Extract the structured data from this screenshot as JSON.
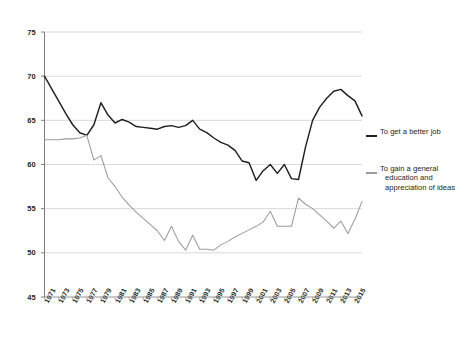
{
  "chart_data": {
    "type": "line",
    "title": "",
    "subtitle": "",
    "xlabel": "",
    "ylabel": "",
    "ylim": [
      45,
      75
    ],
    "ytick_values": [
      45,
      50,
      55,
      60,
      65,
      70,
      75
    ],
    "ytick_labels": [
      "45",
      "50",
      "55",
      "60",
      "65",
      "70",
      "75"
    ],
    "xlim": [
      1971,
      2016
    ],
    "xtick_labels": [
      "1971",
      "1973",
      "1975",
      "1977",
      "1979",
      "1981",
      "1983",
      "1985",
      "1987",
      "1989",
      "1991",
      "1993",
      "1995",
      "1997",
      "1999",
      "2001",
      "2003",
      "2005",
      "2007",
      "2009",
      "2011",
      "2013",
      "2015"
    ],
    "x": [
      1971,
      1972,
      1973,
      1974,
      1975,
      1976,
      1977,
      1978,
      1979,
      1980,
      1981,
      1982,
      1983,
      1984,
      1985,
      1986,
      1987,
      1988,
      1989,
      1990,
      1991,
      1992,
      1993,
      1994,
      1995,
      1996,
      1997,
      1998,
      1999,
      2000,
      2001,
      2002,
      2003,
      2004,
      2005,
      2006,
      2007,
      2008,
      2009,
      2010,
      2011,
      2012,
      2013,
      2014,
      2015,
      2016
    ],
    "grid": true,
    "grid_axis": "y",
    "legend_position": "right",
    "series": [
      {
        "name": "To get a better job",
        "color": "#231f20",
        "values": [
          70.0,
          68.6,
          67.2,
          65.8,
          64.5,
          63.6,
          63.3,
          64.5,
          67.0,
          65.6,
          64.7,
          65.1,
          64.8,
          64.3,
          64.2,
          64.1,
          64.0,
          64.3,
          64.4,
          64.2,
          64.4,
          65.0,
          64.0,
          63.6,
          63.0,
          62.5,
          62.2,
          61.6,
          60.4,
          60.2,
          58.2,
          59.3,
          60.0,
          59.0,
          60.0,
          58.4,
          58.3,
          62.0,
          65.0,
          66.5,
          67.5,
          68.3,
          68.5,
          67.8,
          67.2,
          65.5
        ]
      },
      {
        "name": "To gain a general education and appreciation of ideas",
        "color": "#9b9b9b",
        "values": [
          62.8,
          62.8,
          62.8,
          62.9,
          62.9,
          63.0,
          63.3,
          60.5,
          61.0,
          58.5,
          57.5,
          56.3,
          55.4,
          54.6,
          53.9,
          53.2,
          52.5,
          51.4,
          53.0,
          51.3,
          50.3,
          52.0,
          50.4,
          50.4,
          50.3,
          50.9,
          51.3,
          51.8,
          52.2,
          52.6,
          53.0,
          53.5,
          54.7,
          53.0,
          53.0,
          53.0,
          56.2,
          55.5,
          55.0,
          54.3,
          53.6,
          52.8,
          53.6,
          52.2,
          53.8,
          55.8
        ]
      }
    ]
  },
  "legend": {
    "items": [
      {
        "label": "To get a better job",
        "line1": "To get a better job",
        "line2": "",
        "line3": "",
        "color": "#231f20"
      },
      {
        "label": "To gain a general education and appreciation of ideas",
        "line1": "To gain a general",
        "line2": "education and",
        "line3": "appreciation of ideas",
        "color": "#9b9b9b"
      }
    ]
  }
}
